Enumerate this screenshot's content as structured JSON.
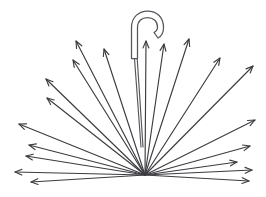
{
  "figure": {
    "style": "line-art outline illustration",
    "background_color": "#ffffff",
    "stroke_color": "#3c3c41",
    "handle_stroke_color": "#55555c",
    "canvas": {
      "width": 266,
      "height": 197
    },
    "origin": {
      "x": 145,
      "y": 175
    },
    "handle": {
      "name": "umbrella-hook-handle",
      "outline_path": "M 131.5 58.5 L 131.5 27.5 C 131.5 16.5 139.5 11.0 147.5 11.0 C 156.5 11.0 163.5 17.0 163.5 27.5 C 163.5 33.0 161.0 36.5 158.0 38.0 L 154.0 32.5 C 156.0 31.5 157.5 30.0 157.5 27.0 C 157.5 21.0 153.0 17.5 147.5 17.5 C 142.0 17.5 137.5 21.0 137.5 27.5 L 137.5 58.5 Z",
      "shaft_path": "M 134.5 58.5 L 141.0 147.0 M 137.2 58.5 L 143.0 147.0"
    },
    "rays": [
      {
        "name": "ray-1",
        "tip_x": 76,
        "tip_y": 41,
        "has_arrowhead": true
      },
      {
        "name": "ray-2",
        "tip_x": 104,
        "tip_y": 49,
        "has_arrowhead": true
      },
      {
        "name": "ray-3",
        "tip_x": 73,
        "tip_y": 60,
        "has_arrowhead": true
      },
      {
        "name": "ray-4",
        "tip_x": 46,
        "tip_y": 79,
        "has_arrowhead": true
      },
      {
        "name": "ray-5",
        "tip_x": 47,
        "tip_y": 98,
        "has_arrowhead": true
      },
      {
        "name": "ray-6",
        "tip_x": 19,
        "tip_y": 124,
        "has_arrowhead": true
      },
      {
        "name": "ray-7",
        "tip_x": 29,
        "tip_y": 145,
        "has_arrowhead": true
      },
      {
        "name": "ray-8",
        "tip_x": 26,
        "tip_y": 156,
        "has_arrowhead": true
      },
      {
        "name": "ray-9",
        "tip_x": 15,
        "tip_y": 172,
        "has_arrowhead": true
      },
      {
        "name": "ray-10",
        "tip_x": 31,
        "tip_y": 182,
        "has_arrowhead": true
      },
      {
        "name": "ray-11",
        "tip_x": 146,
        "tip_y": 41,
        "has_arrowhead": true
      },
      {
        "name": "ray-12",
        "tip_x": 164,
        "tip_y": 44,
        "has_arrowhead": true
      },
      {
        "name": "ray-13",
        "tip_x": 189,
        "tip_y": 39,
        "has_arrowhead": true
      },
      {
        "name": "ray-14",
        "tip_x": 220,
        "tip_y": 58,
        "has_arrowhead": true
      },
      {
        "name": "ray-15",
        "tip_x": 253,
        "tip_y": 66,
        "has_arrowhead": true
      },
      {
        "name": "ray-16",
        "tip_x": 255,
        "tip_y": 120,
        "has_arrowhead": true
      },
      {
        "name": "ray-17",
        "tip_x": 250,
        "tip_y": 146,
        "has_arrowhead": true
      },
      {
        "name": "ray-18",
        "tip_x": 237,
        "tip_y": 162,
        "has_arrowhead": true
      },
      {
        "name": "ray-19",
        "tip_x": 252,
        "tip_y": 170,
        "has_arrowhead": true
      },
      {
        "name": "ray-20",
        "tip_x": 249,
        "tip_y": 181,
        "has_arrowhead": true
      }
    ]
  }
}
